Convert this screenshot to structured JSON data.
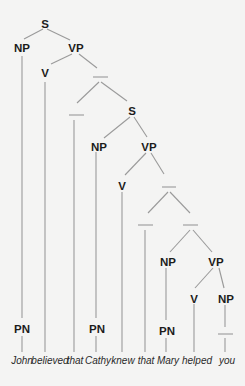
{
  "diagram": {
    "type": "syntax-tree",
    "sentence": "John believed that Cathy knew that Mary helped you",
    "colors": {
      "background": "#f4f4f3",
      "lines": "#9a9a9a",
      "labels": "#1c1c1c"
    },
    "nodes": {
      "s1": "S",
      "np1": "NP",
      "vp1": "VP",
      "v1": "V",
      "s2": "S",
      "np2": "NP",
      "vp2": "VP",
      "v2": "V",
      "np3": "NP",
      "vp3": "VP",
      "v3": "V",
      "np4": "NP",
      "pn1": "PN",
      "pn2": "PN",
      "pn3": "PN"
    },
    "empty_nodes": [
      "bar1",
      "bar2",
      "bar3",
      "bar4",
      "bar5",
      "bar6"
    ],
    "words": [
      "John",
      "believed",
      "that",
      "Cathy",
      "knew",
      "that",
      "Mary",
      "helped",
      "you"
    ]
  }
}
